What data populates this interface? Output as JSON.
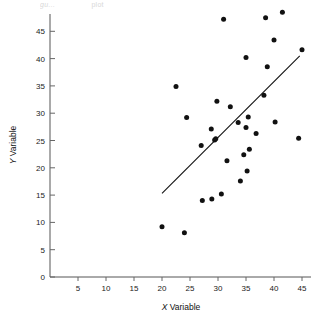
{
  "figure": {
    "caption_fragment_a": "gu...",
    "caption_fragment_b": "plot",
    "xlabel_prefix": "X",
    "xlabel_text": " Variable",
    "ylabel_prefix": "Y",
    "ylabel_text": " Variable"
  },
  "chart_data": {
    "type": "scatter",
    "title": "",
    "xlabel": "X Variable",
    "ylabel": "Y Variable",
    "xlim": [
      0,
      47
    ],
    "ylim": [
      0,
      49
    ],
    "xticks": [
      5,
      10,
      15,
      20,
      25,
      30,
      35,
      40,
      45
    ],
    "yticks": [
      0,
      5,
      10,
      15,
      20,
      25,
      30,
      35,
      40,
      45
    ],
    "grid": false,
    "legend": null,
    "marker": "filled-circle",
    "marker_color": "#111111",
    "points": [
      {
        "x": 20.0,
        "y": 9.2
      },
      {
        "x": 22.5,
        "y": 34.9
      },
      {
        "x": 24.0,
        "y": 8.1
      },
      {
        "x": 24.4,
        "y": 29.2
      },
      {
        "x": 27.0,
        "y": 24.1
      },
      {
        "x": 27.2,
        "y": 14.0
      },
      {
        "x": 28.8,
        "y": 27.1
      },
      {
        "x": 28.9,
        "y": 14.3
      },
      {
        "x": 29.4,
        "y": 25.1
      },
      {
        "x": 29.6,
        "y": 25.3
      },
      {
        "x": 29.8,
        "y": 32.2
      },
      {
        "x": 30.6,
        "y": 15.2
      },
      {
        "x": 31.0,
        "y": 47.2
      },
      {
        "x": 31.6,
        "y": 21.3
      },
      {
        "x": 32.2,
        "y": 31.2
      },
      {
        "x": 33.6,
        "y": 28.3
      },
      {
        "x": 34.0,
        "y": 17.6
      },
      {
        "x": 34.6,
        "y": 22.4
      },
      {
        "x": 35.0,
        "y": 40.2
      },
      {
        "x": 35.0,
        "y": 27.4
      },
      {
        "x": 35.2,
        "y": 19.4
      },
      {
        "x": 35.4,
        "y": 29.3
      },
      {
        "x": 35.6,
        "y": 23.4
      },
      {
        "x": 36.8,
        "y": 26.3
      },
      {
        "x": 38.2,
        "y": 33.3
      },
      {
        "x": 38.5,
        "y": 47.5
      },
      {
        "x": 38.8,
        "y": 38.5
      },
      {
        "x": 40.0,
        "y": 43.4
      },
      {
        "x": 40.2,
        "y": 28.4
      },
      {
        "x": 41.5,
        "y": 48.5
      },
      {
        "x": 44.4,
        "y": 25.4
      },
      {
        "x": 45.0,
        "y": 41.6
      }
    ],
    "fit_line": {
      "type": "linear-trend",
      "x_start": 20.0,
      "y_start": 15.3,
      "x_end": 44.6,
      "y_end": 40.5
    }
  }
}
